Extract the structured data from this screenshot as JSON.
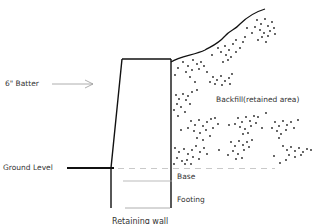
{
  "diagram": {
    "title": "Retaining wall",
    "labels": {
      "batter": "6\" Batter",
      "backfill": "Backfill(retained area)",
      "ground_level": "Ground Level",
      "base": "Base",
      "footing": "Footing"
    },
    "colors": {
      "line": "#111111",
      "text": "#333333",
      "dashed": "#bbbbbb",
      "dots": "#222222"
    }
  }
}
